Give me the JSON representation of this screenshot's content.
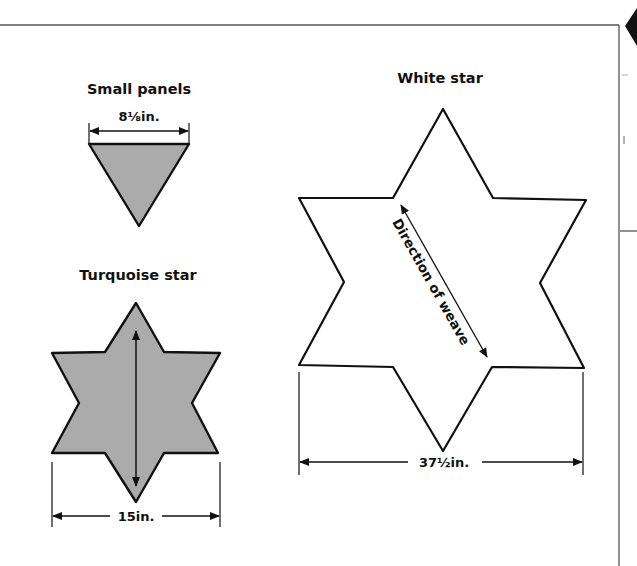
{
  "diagram": {
    "small_panels": {
      "title": "Small panels",
      "dimension": "8⅛in.",
      "shape": "inverted-triangle",
      "fill": "#ababab"
    },
    "turquoise_star": {
      "title": "Turquoise star",
      "dimension": "15in.",
      "shape": "six-pointed-star",
      "fill": "#ababab",
      "arrow": "vertical double-headed"
    },
    "white_star": {
      "title": "White star",
      "dimension": "37½in.",
      "shape": "six-pointed-star",
      "fill": "#ffffff",
      "arrow_label": "Direction of weave"
    }
  },
  "colors": {
    "stroke": "#111111",
    "panel_fill": "#ababab",
    "frame": "#555555",
    "background": "#ffffff"
  }
}
